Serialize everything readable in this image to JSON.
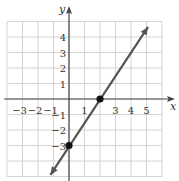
{
  "chart_data": {
    "type": "line",
    "title": "",
    "xlabel": "x",
    "ylabel": "y",
    "xlim": [
      -4,
      6
    ],
    "ylim": [
      -5,
      5
    ],
    "grid": true,
    "x_ticks": [
      -3,
      -2,
      -1,
      1,
      3,
      4,
      5
    ],
    "y_ticks": [
      4,
      3,
      2,
      1,
      -1,
      -2,
      -3
    ],
    "x_tick_labels": [
      "−3",
      "−2",
      "−1",
      "1",
      "3",
      "4",
      "5"
    ],
    "y_tick_labels": [
      "4",
      "3",
      "2",
      "1",
      "−1",
      "−2",
      "−3"
    ],
    "series": [
      {
        "name": "line",
        "equation": "y = 1.5x - 3",
        "x": [
          -1.2,
          5.1
        ],
        "y": [
          -4.9,
          4.65
        ],
        "arrows": "both",
        "color": "#555555"
      }
    ],
    "points": [
      {
        "x": 2,
        "y": 0
      },
      {
        "x": 0,
        "y": -3
      }
    ],
    "legend": null
  },
  "colors": {
    "grid": "#d4d4d4",
    "axis": "#444444",
    "line": "#555555",
    "point": "#111111"
  }
}
